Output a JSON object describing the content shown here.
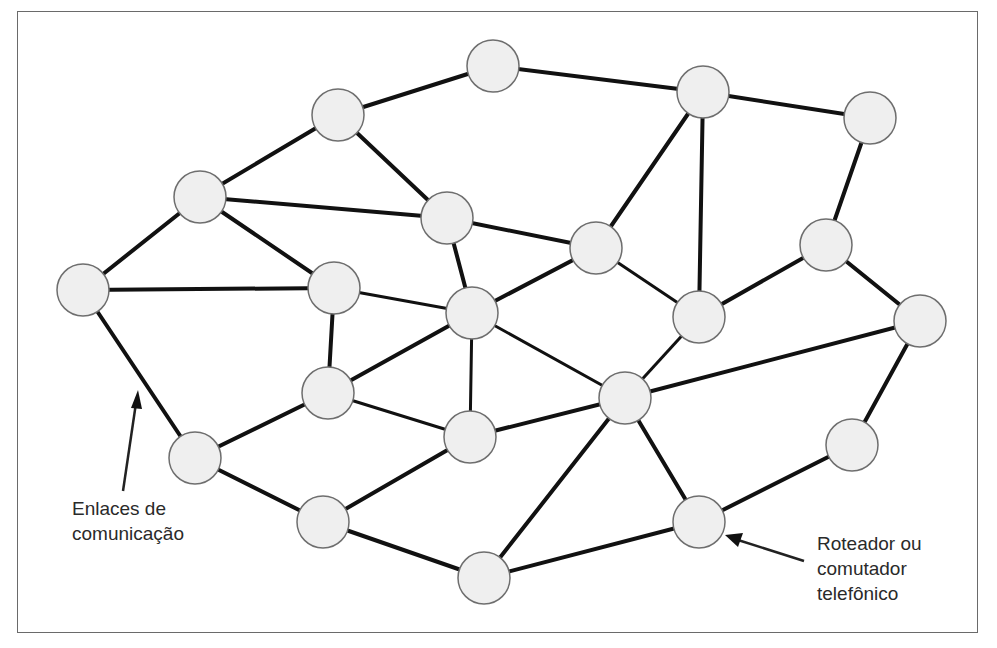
{
  "diagram": {
    "type": "mesh-network",
    "node_style": {
      "fill": "#efefef",
      "stroke": "#6e6e6e",
      "radius": 26
    },
    "edge_color": "#111111",
    "nodes": [
      {
        "id": "n1",
        "x": 83,
        "y": 290
      },
      {
        "id": "n2",
        "x": 200,
        "y": 197
      },
      {
        "id": "n3",
        "x": 338,
        "y": 115
      },
      {
        "id": "n4",
        "x": 493,
        "y": 66
      },
      {
        "id": "n5",
        "x": 703,
        "y": 92
      },
      {
        "id": "n6",
        "x": 870,
        "y": 118
      },
      {
        "id": "n7",
        "x": 447,
        "y": 218
      },
      {
        "id": "n8",
        "x": 334,
        "y": 288
      },
      {
        "id": "n9",
        "x": 472,
        "y": 313
      },
      {
        "id": "n10",
        "x": 596,
        "y": 248
      },
      {
        "id": "n11",
        "x": 826,
        "y": 245
      },
      {
        "id": "n12",
        "x": 699,
        "y": 317
      },
      {
        "id": "n13",
        "x": 920,
        "y": 321
      },
      {
        "id": "n14",
        "x": 328,
        "y": 393
      },
      {
        "id": "n15",
        "x": 625,
        "y": 398
      },
      {
        "id": "n16",
        "x": 470,
        "y": 437
      },
      {
        "id": "n17",
        "x": 195,
        "y": 458
      },
      {
        "id": "n18",
        "x": 852,
        "y": 445
      },
      {
        "id": "n19",
        "x": 323,
        "y": 522
      },
      {
        "id": "n20",
        "x": 699,
        "y": 522
      },
      {
        "id": "n21",
        "x": 484,
        "y": 578
      }
    ],
    "edges": [
      [
        "n1",
        "n2"
      ],
      [
        "n1",
        "n8"
      ],
      [
        "n1",
        "n17"
      ],
      [
        "n2",
        "n3"
      ],
      [
        "n2",
        "n7"
      ],
      [
        "n2",
        "n8"
      ],
      [
        "n3",
        "n4"
      ],
      [
        "n3",
        "n7"
      ],
      [
        "n4",
        "n5"
      ],
      [
        "n5",
        "n6"
      ],
      [
        "n5",
        "n10"
      ],
      [
        "n5",
        "n12"
      ],
      [
        "n6",
        "n11"
      ],
      [
        "n7",
        "n9"
      ],
      [
        "n7",
        "n10"
      ],
      [
        "n8",
        "n9"
      ],
      [
        "n8",
        "n14"
      ],
      [
        "n9",
        "n10"
      ],
      [
        "n9",
        "n14"
      ],
      [
        "n9",
        "n15"
      ],
      [
        "n9",
        "n16"
      ],
      [
        "n10",
        "n12"
      ],
      [
        "n11",
        "n12"
      ],
      [
        "n11",
        "n13"
      ],
      [
        "n12",
        "n15"
      ],
      [
        "n13",
        "n15"
      ],
      [
        "n13",
        "n18"
      ],
      [
        "n14",
        "n16"
      ],
      [
        "n14",
        "n17"
      ],
      [
        "n15",
        "n16"
      ],
      [
        "n15",
        "n20"
      ],
      [
        "n15",
        "n21"
      ],
      [
        "n16",
        "n19"
      ],
      [
        "n17",
        "n19"
      ],
      [
        "n18",
        "n20"
      ],
      [
        "n19",
        "n21"
      ],
      [
        "n20",
        "n21"
      ]
    ]
  },
  "annotations": {
    "links_label": "Enlaces de\ncomunicação",
    "router_label": "Roteador ou\ncomutador\ntelefônico"
  }
}
